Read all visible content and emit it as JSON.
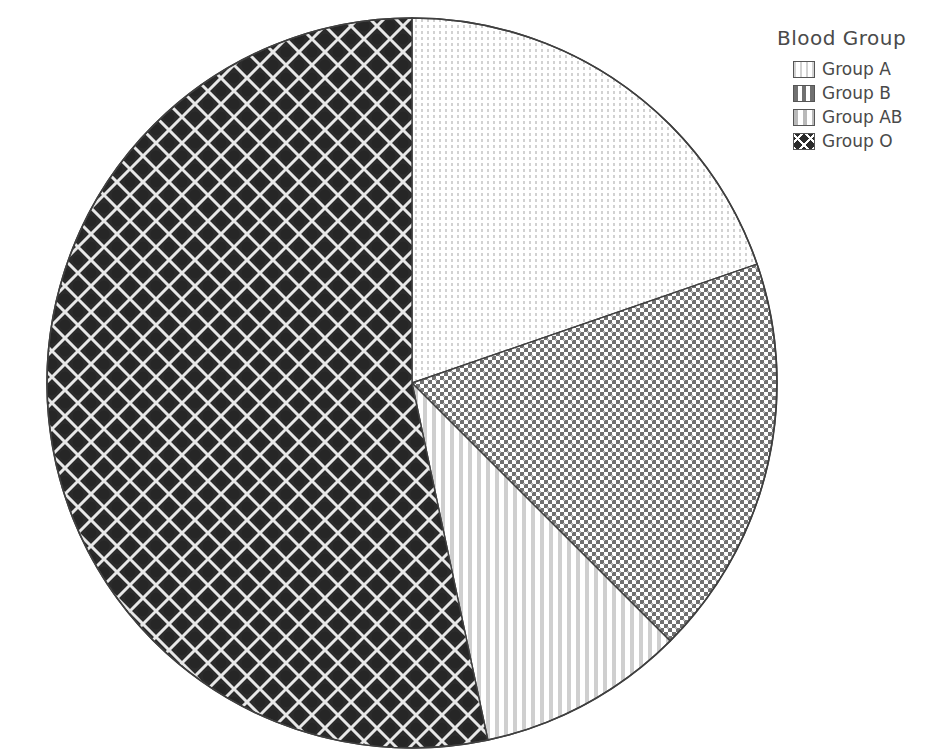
{
  "chart_data": {
    "type": "pie",
    "title": "",
    "legend_title": "Blood Group",
    "legend_position": "top-right",
    "categories": [
      "Group A",
      "Group B",
      "Group AB",
      "Group O"
    ],
    "values": [
      19.7,
      17.8,
      9.2,
      53.3
    ],
    "angles_deg": [
      71,
      64,
      33,
      192
    ],
    "start_angle_deg": 0,
    "direction": "clockwise",
    "units": "percent",
    "xlabel": "",
    "ylabel": "",
    "grid": false,
    "slices": [
      {
        "label": "Group A",
        "value": 19.7,
        "angle_deg": 71,
        "start_deg": 0,
        "end_deg": 71,
        "pattern": "fine-dots-light",
        "color": "#fbfbfb"
      },
      {
        "label": "Group B",
        "value": 17.8,
        "angle_deg": 64,
        "start_deg": 71,
        "end_deg": 135,
        "pattern": "crosshatch-grid-medium",
        "color": "#8f8f8f"
      },
      {
        "label": "Group AB",
        "value": 9.2,
        "angle_deg": 33,
        "start_deg": 135,
        "end_deg": 168,
        "pattern": "vertical-stripes-light",
        "color": "#d8d8d8"
      },
      {
        "label": "Group O",
        "value": 53.3,
        "angle_deg": 192,
        "start_deg": 168,
        "end_deg": 360,
        "pattern": "diagonal-diamond-dark",
        "color": "#3a3a3a"
      }
    ],
    "geometry": {
      "center_x": 412,
      "center_y": 383,
      "radius": 365
    }
  },
  "legend": {
    "title": "Blood Group",
    "items": [
      {
        "label": "Group A"
      },
      {
        "label": "Group B"
      },
      {
        "label": "Group AB"
      },
      {
        "label": "Group O"
      }
    ]
  }
}
